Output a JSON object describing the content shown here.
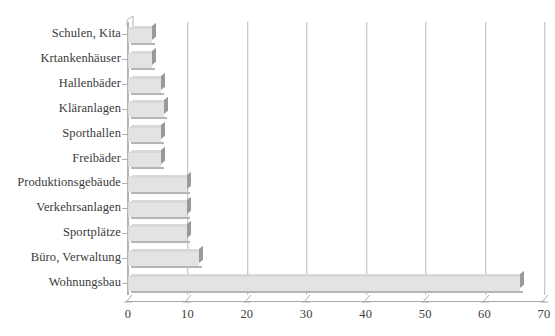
{
  "chart_data": {
    "type": "bar",
    "orientation": "horizontal",
    "title": "",
    "subtitle": "",
    "xlabel": "",
    "ylabel": "",
    "xlim": [
      0,
      70
    ],
    "ylim": null,
    "grid": true,
    "grid_axis": "x",
    "legend": false,
    "legend_position": "none",
    "categories": [
      "Schulen, Kita",
      "Krtankenhäuser",
      "Hallenbäder",
      "Kläranlagen",
      "Sporthallen",
      "Freibäder",
      "Produktionsgebäude",
      "Verkehrsanlagen",
      "Sportplätze",
      "Büro, Verwaltung",
      "Wohnungsbau"
    ],
    "values": [
      4,
      4,
      5.5,
      6,
      5.5,
      5.5,
      10,
      10,
      10,
      12,
      66
    ],
    "xticks": [
      0,
      10,
      20,
      30,
      40,
      50,
      60,
      70
    ],
    "xtick_labels": [
      "0",
      "10",
      "20",
      "30",
      "40",
      "50",
      "60",
      "70"
    ],
    "series": [
      {
        "name": "",
        "values": [
          4,
          4,
          5.5,
          6,
          5.5,
          5.5,
          10,
          10,
          10,
          12,
          66
        ]
      }
    ]
  },
  "style": {
    "background": "#ffffff",
    "bar_fill": "#e3e3e3",
    "bar_shadow": "#9a9a9a",
    "gridline_color": "#c9c9c9",
    "axis_color": "#b0b0b0",
    "text_color": "#3a3a3a"
  }
}
